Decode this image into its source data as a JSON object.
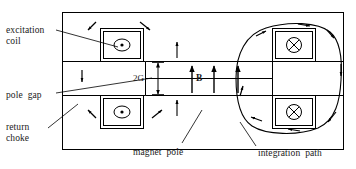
{
  "figure": {
    "background": "#ffffff",
    "line_color": "#000000",
    "outer_frame": {
      "x": 62,
      "y": 12,
      "w": 282,
      "h": 138
    }
  },
  "labels": {
    "excitation_coil": "excitation\ncoil",
    "pole_gap": "pole  gap",
    "return_choke": "return\nchoke",
    "magnet_pole": "magnet  pole",
    "integration_path": "integration  path",
    "gap_dimension": "2G",
    "field_symbol": "B"
  },
  "coils": [
    {
      "id": "coil-top-left",
      "symbol": "dot",
      "glyph": "⊙",
      "x": 100,
      "y": 28,
      "w": 44,
      "h": 33
    },
    {
      "id": "coil-bottom-left",
      "symbol": "dot",
      "glyph": "⊙",
      "x": 100,
      "y": 96,
      "w": 44,
      "h": 33
    },
    {
      "id": "coil-top-right",
      "symbol": "cross",
      "glyph": "⊗",
      "x": 272,
      "y": 28,
      "w": 44,
      "h": 33
    },
    {
      "id": "coil-bottom-right",
      "symbol": "cross",
      "glyph": "⊗",
      "x": 272,
      "y": 96,
      "w": 44,
      "h": 33
    }
  ],
  "field_arrows": {
    "description": "three vertical up-arrows in the pole gap denoting flux density B",
    "count": 3,
    "direction": "up"
  },
  "return_flux_arrows": {
    "description": "small arrows in the return choke region circulating around the yoke",
    "count": 12
  },
  "integration_path": {
    "description": "closed rounded contour enclosing the right-hand pole and both right coils",
    "arrow_count": 8,
    "sense": "counter-clockwise"
  },
  "gap": {
    "value": "2G",
    "description": "vertical double-headed dimension arrow spanning the pole gap"
  }
}
